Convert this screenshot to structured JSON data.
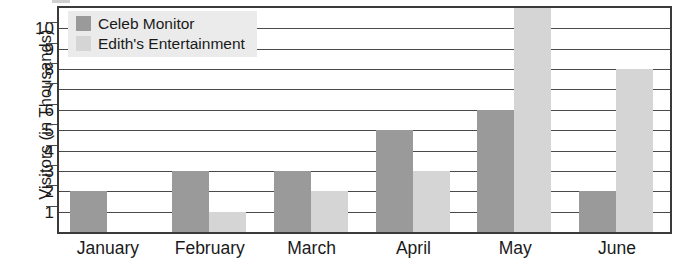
{
  "chart_data": {
    "type": "bar",
    "title": "",
    "subtitle": "",
    "xlabel": "",
    "ylabel": "Visitors (in Thousands)",
    "categories": [
      "January",
      "February",
      "March",
      "April",
      "May",
      "June"
    ],
    "series": [
      {
        "name": "Celeb Monitor",
        "color": "#9a9a9a",
        "values": [
          2,
          3,
          3,
          5,
          6,
          2
        ]
      },
      {
        "name": "Edith's Entertainment",
        "color": "#d5d5d5",
        "values": [
          0,
          1,
          2,
          3,
          11,
          8
        ]
      }
    ],
    "ylim": [
      0,
      11
    ],
    "yticks": [
      1,
      2,
      3,
      4,
      5,
      6,
      7,
      8,
      9,
      10
    ],
    "ytick_labels": [
      "1",
      "2",
      "3",
      "4",
      "5",
      "6",
      "7",
      "8",
      "9",
      "10"
    ],
    "grid": true,
    "grid_axis": "y",
    "legend": true,
    "legend_position": "top-left-inside"
  },
  "axis": {
    "y_title": "Visitors (in Thousands)"
  },
  "legend": {
    "entries": [
      {
        "label": "Celeb Monitor",
        "swatch": "legend-swatch-dark"
      },
      {
        "label": "Edith's Entertainment",
        "swatch": "legend-swatch-light"
      }
    ]
  },
  "colors": {
    "series_celeb_monitor": "#9a9a9a",
    "series_ediths_entertainment": "#d5d5d5",
    "frame": "#3a3a3a",
    "gridline": "#4a4a4a",
    "legend_background": "#ebebeb",
    "text": "#1a1a1a",
    "plot_background": "#ffffff"
  }
}
